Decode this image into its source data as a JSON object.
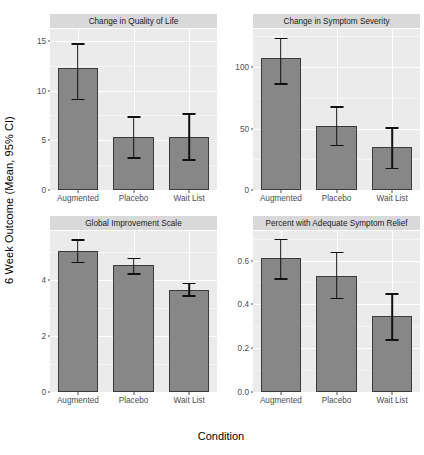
{
  "chart_data": {
    "type": "bar",
    "title": "",
    "xlabel": "Condition",
    "ylabel": "6 Week Outcome (Mean, 95% CI)",
    "categories": [
      "Augmented",
      "Placebo",
      "Wait List"
    ],
    "grid": true,
    "legend": "none",
    "error_bars": "95% CI",
    "bar_color": "#878787",
    "bar_border_color": "#3b3b3b",
    "panel_background": "#ebebeb",
    "strip_background": "#d9d9d9",
    "gridline_color": "#ffffff",
    "facets": [
      {
        "id": "quality-of-life",
        "title": "Change in Quality of Life",
        "ylim": [
          0,
          16.2
        ],
        "yticks": [
          0,
          5,
          10,
          15
        ],
        "ytick_labels": [
          "0",
          "5",
          "10",
          "15"
        ],
        "values": [
          12.3,
          5.3,
          5.3
        ],
        "ci_low": [
          9.2,
          3.3,
          3.1
        ],
        "ci_high": [
          14.8,
          7.4,
          7.7
        ]
      },
      {
        "id": "symptom-severity",
        "title": "Change in Symptom Severity",
        "ylim": [
          0,
          131
        ],
        "yticks": [
          0,
          50,
          100
        ],
        "ytick_labels": [
          "0",
          "50",
          "100"
        ],
        "values": [
          107,
          52,
          35
        ],
        "ci_low": [
          87,
          37,
          18
        ],
        "ci_high": [
          124,
          68,
          51
        ]
      },
      {
        "id": "global-improvement-scale",
        "title": "Global Improvement Scale",
        "ylim": [
          0,
          5.75
        ],
        "yticks": [
          0,
          2,
          4
        ],
        "ytick_labels": [
          "0",
          "2",
          "4"
        ],
        "values": [
          5.05,
          4.55,
          3.65
        ],
        "ci_low": [
          4.65,
          4.25,
          3.45
        ],
        "ci_high": [
          5.45,
          4.8,
          3.9
        ]
      },
      {
        "id": "adequate-symptom-relief",
        "title": "Percent with Adequate Symptom Relief",
        "ylim": [
          0,
          0.735
        ],
        "yticks": [
          0.0,
          0.2,
          0.4,
          0.6
        ],
        "ytick_labels": [
          "0.0",
          "0.2",
          "0.4",
          "0.6"
        ],
        "values": [
          0.61,
          0.53,
          0.345
        ],
        "ci_low": [
          0.52,
          0.43,
          0.24
        ],
        "ci_high": [
          0.7,
          0.64,
          0.45
        ]
      }
    ]
  }
}
